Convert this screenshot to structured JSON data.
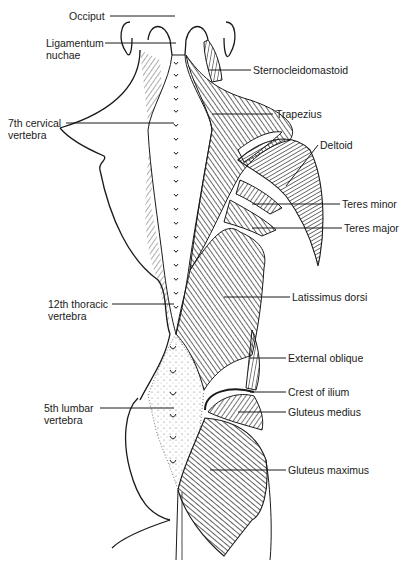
{
  "figure": {
    "ink_color": "#1a1a1a",
    "background": "#ffffff"
  },
  "labels_left": [
    {
      "id": "occiput",
      "line1": "Occiput",
      "line2": ""
    },
    {
      "id": "ligamentum-nuchae",
      "line1": "Ligamentum",
      "line2": "nuchae"
    },
    {
      "id": "c7",
      "line1": "7th cervical",
      "line2": "vertebra"
    },
    {
      "id": "t12",
      "line1": "12th thoracic",
      "line2": "vertebra"
    },
    {
      "id": "l5",
      "line1": "5th lumbar",
      "line2": "vertebra"
    }
  ],
  "labels_right": [
    {
      "id": "sternocleidomastoid",
      "line1": "Sternocleidomastoid"
    },
    {
      "id": "trapezius",
      "line1": "Trapezius"
    },
    {
      "id": "deltoid",
      "line1": "Deltoid"
    },
    {
      "id": "teres-minor",
      "line1": "Teres minor"
    },
    {
      "id": "teres-major",
      "line1": "Teres major"
    },
    {
      "id": "latissimus-dorsi",
      "line1": "Latissimus dorsi"
    },
    {
      "id": "external-oblique",
      "line1": "External oblique"
    },
    {
      "id": "crest-of-ilium",
      "line1": "Crest of ilium"
    },
    {
      "id": "gluteus-medius",
      "line1": "Gluteus medius"
    },
    {
      "id": "gluteus-maximus",
      "line1": "Gluteus maximus"
    }
  ]
}
